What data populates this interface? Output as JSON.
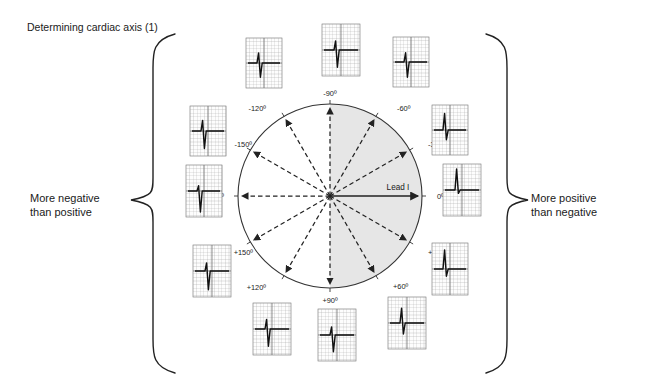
{
  "title": "Determining cardiac axis (1)",
  "left_annotation": {
    "line1": "More negative",
    "line2": "than positive"
  },
  "right_annotation": {
    "line1": "More positive",
    "line2": "than negative"
  },
  "lead_axis_label": "Lead I",
  "colors": {
    "background": "#ffffff",
    "text": "#1a1a1a",
    "circle_stroke": "#333333",
    "shaded_half": "#e6e6e6",
    "arrow": "#222222",
    "ecg_grid": "#9a9a9a",
    "ecg_grid_major": "#6f6f6f",
    "ecg_trace": "#111111",
    "brace": "#222222"
  },
  "diagram": {
    "type": "cardiac-axis-hexaxial-reference",
    "center": {
      "x": 330,
      "y": 196
    },
    "radius": 92,
    "shaded_sector": {
      "from_deg": -90,
      "to_deg": 90,
      "description": "right half positive in Lead I"
    },
    "axes": [
      {
        "label": "-90º",
        "angle": -90,
        "style": "dashed",
        "label_x": 330,
        "label_y": 96,
        "anchor": "middle"
      },
      {
        "label": "-60º",
        "angle": -60,
        "style": "dashed",
        "label_x": 397,
        "label_y": 111,
        "anchor": "start"
      },
      {
        "label": "-30º",
        "angle": -30,
        "style": "dashed",
        "label_x": 428,
        "label_y": 147,
        "anchor": "start"
      },
      {
        "label": "0º",
        "angle": 0,
        "style": "solid",
        "label_x": 437,
        "label_y": 199,
        "anchor": "start"
      },
      {
        "label": "+30º",
        "angle": 30,
        "style": "dashed",
        "label_x": 428,
        "label_y": 255,
        "anchor": "start"
      },
      {
        "label": "+60º",
        "angle": 60,
        "style": "dashed",
        "label_x": 393,
        "label_y": 289,
        "anchor": "start"
      },
      {
        "label": "+90º",
        "angle": 90,
        "style": "dashed",
        "label_x": 330,
        "label_y": 303,
        "anchor": "middle"
      },
      {
        "label": "+120º",
        "angle": 120,
        "style": "dashed",
        "label_x": 266,
        "label_y": 290,
        "anchor": "end"
      },
      {
        "label": "+150º",
        "angle": 150,
        "style": "dashed",
        "label_x": 253,
        "label_y": 255,
        "anchor": "end"
      },
      {
        "label": "180º",
        "angle": 180,
        "style": "dashed",
        "label_x": 224,
        "label_y": 199,
        "anchor": "end"
      },
      {
        "label": "-150º",
        "angle": -150,
        "style": "dashed",
        "label_x": 252,
        "label_y": 147,
        "anchor": "end"
      },
      {
        "label": "-120º",
        "angle": -120,
        "style": "dashed",
        "label_x": 266,
        "label_y": 111,
        "anchor": "end"
      }
    ],
    "ecg_strips": [
      {
        "axis": "-90º",
        "x": 322,
        "y": 24,
        "w": 38,
        "h": 52,
        "r_amp": 0.38,
        "s_amp": 0.72,
        "description": "equiphasic, dominant S"
      },
      {
        "axis": "-60º",
        "x": 393,
        "y": 37,
        "w": 36,
        "h": 50,
        "r_amp": 0.4,
        "s_amp": 0.66,
        "description": "small R, deep S"
      },
      {
        "axis": "-30º",
        "x": 432,
        "y": 105,
        "w": 36,
        "h": 50,
        "r_amp": 0.72,
        "s_amp": 0.42,
        "description": "dominant R, small S"
      },
      {
        "axis": "0º",
        "x": 443,
        "y": 164,
        "w": 38,
        "h": 52,
        "r_amp": 0.88,
        "s_amp": 0.14,
        "description": "tall positive R"
      },
      {
        "axis": "+30º",
        "x": 432,
        "y": 243,
        "w": 36,
        "h": 52,
        "r_amp": 0.8,
        "s_amp": 0.3,
        "description": "tall R, small S"
      },
      {
        "axis": "+60º",
        "x": 388,
        "y": 297,
        "w": 38,
        "h": 52,
        "r_amp": 0.62,
        "s_amp": 0.46,
        "description": "positive R with S"
      },
      {
        "axis": "+90º",
        "x": 318,
        "y": 309,
        "w": 38,
        "h": 52,
        "r_amp": 0.34,
        "s_amp": 0.7,
        "description": "equiphasic, dominant S"
      },
      {
        "axis": "+120º",
        "x": 253,
        "y": 303,
        "w": 38,
        "h": 52,
        "r_amp": 0.4,
        "s_amp": 0.72,
        "description": "small R, deep S"
      },
      {
        "axis": "+150º",
        "x": 193,
        "y": 245,
        "w": 38,
        "h": 52,
        "r_amp": 0.34,
        "s_amp": 0.78,
        "description": "small R, deep S"
      },
      {
        "axis": "180º",
        "x": 186,
        "y": 165,
        "w": 36,
        "h": 52,
        "r_amp": 0.22,
        "s_amp": 0.88,
        "description": "deep negative S"
      },
      {
        "axis": "-150º",
        "x": 190,
        "y": 106,
        "w": 36,
        "h": 50,
        "r_amp": 0.46,
        "s_amp": 0.76,
        "description": "small R, deep S"
      },
      {
        "axis": "-120º",
        "x": 246,
        "y": 38,
        "w": 36,
        "h": 50,
        "r_amp": 0.44,
        "s_amp": 0.62,
        "description": "small R, deep S"
      }
    ],
    "braces": [
      {
        "side": "left",
        "label": "left-brace"
      },
      {
        "side": "right",
        "label": "right-brace"
      }
    ]
  }
}
